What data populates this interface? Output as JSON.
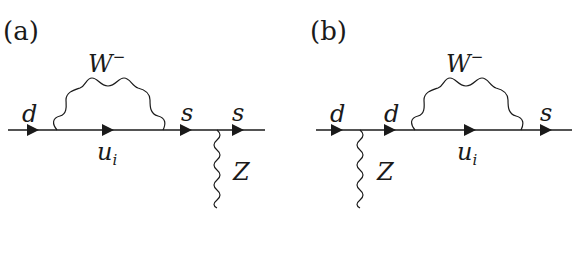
{
  "figure": {
    "panels": [
      {
        "id": "a",
        "label": "(a)",
        "loop_boson": "W",
        "loop_boson_sup": "−",
        "loop_fermion": "u",
        "loop_fermion_sub": "i",
        "external_boson": "Z",
        "fermion_labels": [
          "d",
          "s",
          "s"
        ]
      },
      {
        "id": "b",
        "label": "(b)",
        "loop_boson": "W",
        "loop_boson_sup": "−",
        "loop_fermion": "u",
        "loop_fermion_sub": "i",
        "external_boson": "Z",
        "fermion_labels": [
          "d",
          "d",
          "s"
        ]
      }
    ]
  }
}
